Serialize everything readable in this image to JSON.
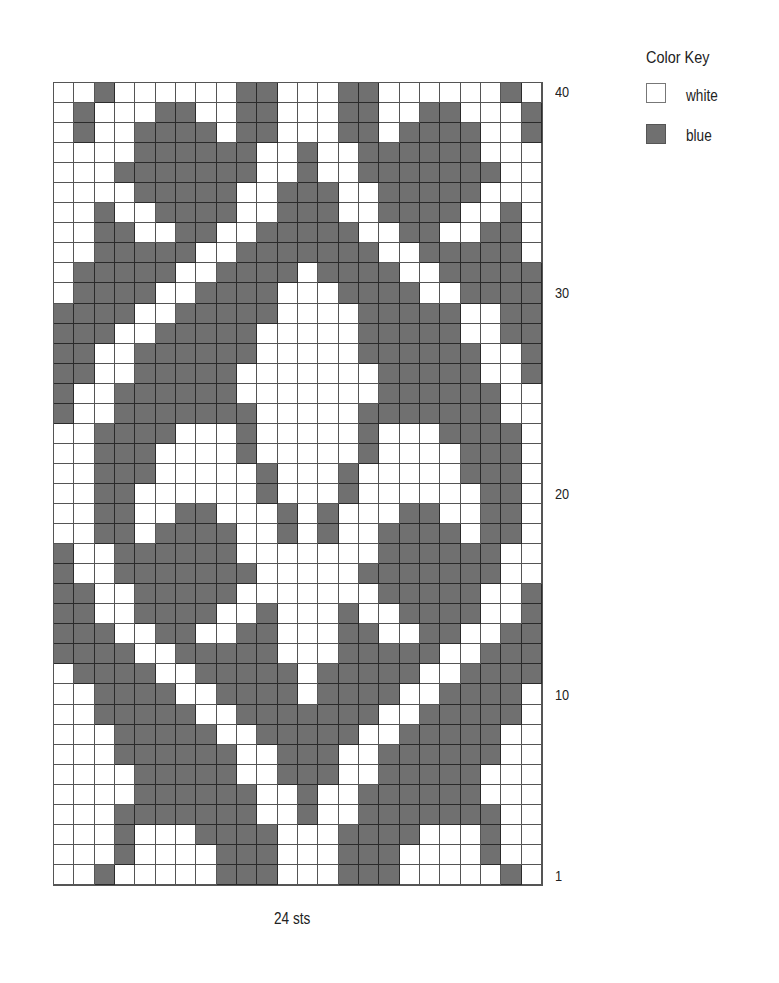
{
  "chart": {
    "stitches_label": "24 sts",
    "columns": 24,
    "rows": 40,
    "row_labels": [
      {
        "row": 40,
        "label": "40"
      },
      {
        "row": 30,
        "label": "30"
      },
      {
        "row": 20,
        "label": "20"
      },
      {
        "row": 10,
        "label": "10"
      },
      {
        "row": 1,
        "label": "1"
      }
    ],
    "grid_top_to_bottom": [
      "WWBWWWWWWBBWWWBBWWWWWWBW",
      "WBWWWBBWWBBWWWBBWWBBWWWB",
      "WBWWBBBBWBBWWWBBWBBBBWWB",
      "WWWWBBBBBBWWBWWBBBBBBWWW",
      "WWWBBBBBBBWWBWWBBBBBBBWW",
      "WWWWBBBBBWWBBBWWBBBBBWWW",
      "WWBWWBBBBWWBBBWWBBBBWWBW",
      "WWBBWWBBWWBBBBBWWBBWWBBW",
      "WWBBBBBWWBBBBBBBWWBBBBBW",
      "WBBBBBWWBBBBWBBBBWWBBBBB",
      "WBBBBWWBBBBWWWBBBBWWBBBB",
      "BBBBWWBBBBBWWWWBBBBBWWBB",
      "BBBWWBBBBBWWWWWBBBBBWWBB",
      "BBWWBBBBBBWWWWWBBBBBBWWB",
      "BBWWBBBBBWWWWWWWBBBBBWWB",
      "BWWBBBBBBWWWWWWWBBBBBBWW",
      "BWWBBBBBBBWWWWWBBBBBBBWW",
      "WWBBBBWWWBWWWWWBWWWBBBBW",
      "WWBBBWWWWBWWWWWBWWWWBBBW",
      "WWBBBWWWWWBWWWBWWWWWBBBW",
      "WWBBWWWWWWBWWWBWWWWWWBBW",
      "WWBBWWBBWWWBWBWWWBBWWBBW",
      "WWBBWBBBBWWBWBWWBBBBWBBW",
      "BWWBBBBBBWWWWWWWBBBBBBWW",
      "BWWBBBBBBBWWWWWBBBBBBBWW",
      "BBWWBBBBBWWWWWWWBBBBBWWB",
      "BBWWBBBBWWBWWWBWWBBBBWWB",
      "BBBWWBBWWBBWWWBBWWBBWWBB",
      "BBBBWWBBBBBWWWBBBBBWWBBB",
      "WBBBBWWBBBBBWBBBBBWWBBBB",
      "WWBBBBWWBBBBWBBBBWWBBBBW",
      "WWBBBBBWWBBBBBBBWWBBBBBW",
      "WWWBBBBBWWBBBBBWWBBBBBWW",
      "WWWBBBBBBWWBBBWWBBBBBBWW",
      "WWWWBBBBBWWBBBWWBBBBBWWW",
      "WWWWBBBBBBWWBWWBBBBBBWWW",
      "WWWBBBBBBBWWBWWBBBBBBBWW",
      "WWWBWWWBBBBWWWBBBBWWWBWW",
      "WWWBWWWWBBBWWWBBBWWWWBWW",
      "WWBWWWWWBBBWWWBBBWWWWWBW"
    ]
  },
  "legend": {
    "title": "Color Key",
    "items": [
      {
        "code": "W",
        "label": "white",
        "color": "#ffffff"
      },
      {
        "code": "B",
        "label": "blue",
        "color": "#707070"
      }
    ]
  },
  "chart_data": {
    "type": "heatmap",
    "xlabel": "24 sts",
    "ylabel": "",
    "y_ticks": [
      "1",
      "10",
      "20",
      "30",
      "40"
    ],
    "legend": [
      "white",
      "blue"
    ],
    "rows_top_to_bottom_40_to_1": "see chart.grid_top_to_bottom (W=white, B=blue)"
  }
}
